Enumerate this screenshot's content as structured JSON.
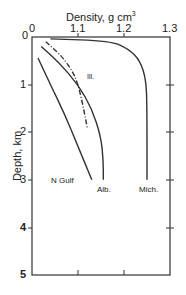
{
  "chart_data": {
    "type": "line",
    "title": "",
    "xlabel": "Density, g cm",
    "xlabel_superscript": "3",
    "ylabel": "Depth, km",
    "xlim": [
      1.0,
      1.3
    ],
    "ylim": [
      0,
      5
    ],
    "y_inverted": true,
    "x_ticks": [
      "0",
      "1.1",
      "1.2",
      "1.3"
    ],
    "y_ticks": [
      "0",
      "1",
      "2",
      "3",
      "4",
      "5"
    ],
    "grid": false,
    "series": [
      {
        "name": "N Gulf",
        "style": "solid",
        "points": [
          [
            1.013,
            0.44
          ],
          [
            1.04,
            1.0
          ],
          [
            1.07,
            1.6
          ],
          [
            1.1,
            2.3
          ],
          [
            1.13,
            3.0
          ]
        ]
      },
      {
        "name": "Alb.",
        "style": "solid",
        "points": [
          [
            1.02,
            0.2
          ],
          [
            1.06,
            0.55
          ],
          [
            1.1,
            1.0
          ],
          [
            1.13,
            1.5
          ],
          [
            1.15,
            2.1
          ],
          [
            1.155,
            2.6
          ],
          [
            1.155,
            3.0
          ]
        ]
      },
      {
        "name": "Ill.",
        "style": "dash-dot",
        "points": [
          [
            1.03,
            0.1
          ],
          [
            1.065,
            0.4
          ],
          [
            1.09,
            0.75
          ],
          [
            1.1,
            1.0
          ],
          [
            1.11,
            1.4
          ],
          [
            1.12,
            1.9
          ]
        ]
      },
      {
        "name": "Mich.",
        "style": "solid",
        "points": [
          [
            1.04,
            0.04
          ],
          [
            1.17,
            0.08
          ],
          [
            1.21,
            0.25
          ],
          [
            1.235,
            0.5
          ],
          [
            1.248,
            0.9
          ],
          [
            1.25,
            1.5
          ],
          [
            1.25,
            3.0
          ]
        ]
      }
    ]
  },
  "labels": {
    "x_axis_title": "Density, g cm",
    "x_axis_sup": "3",
    "y_axis_title": "Depth, km",
    "series_labels": {
      "ngulf": "N Gulf",
      "alb": "Alb.",
      "ill": "Ill.",
      "mich": "Mich."
    },
    "x_ticks": [
      "0",
      "1.1",
      "1.2",
      "1.3"
    ],
    "y_ticks": [
      "0",
      "1",
      "2",
      "3",
      "4",
      "5"
    ]
  }
}
